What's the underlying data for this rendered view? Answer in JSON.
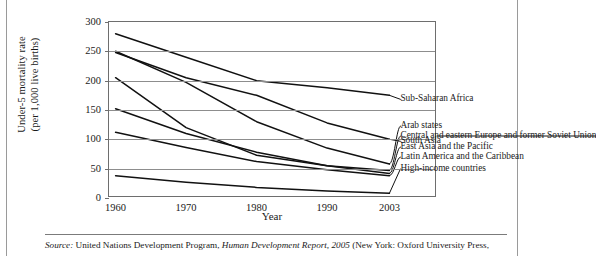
{
  "figure": {
    "source_prefix": "Source:",
    "source_text_a": " United Nations Development Program, ",
    "source_italic": "Human Development Report, 2005",
    "source_text_b": " (New York: Oxford University Press,"
  },
  "chart_data": {
    "type": "line",
    "title": "",
    "xlabel": "Year",
    "ylabel": "Under-5 mortality rate",
    "ylabel_line2": "(per 1,000 live births)",
    "x": [
      1960,
      1970,
      1980,
      1990,
      2003
    ],
    "xticklabels": [
      "1960",
      "1970",
      "1980",
      "1990",
      "2003"
    ],
    "yticklabels": [
      "0",
      "50",
      "100",
      "150",
      "200",
      "250",
      "300"
    ],
    "yticks": [
      0,
      50,
      100,
      150,
      200,
      250,
      300
    ],
    "ylim": [
      0,
      300
    ],
    "xlim": [
      1960,
      2003
    ],
    "grid": true,
    "legend": "inline-right-labels",
    "series": [
      {
        "name": "Sub-Saharan Africa",
        "values": [
          280,
          240,
          200,
          188,
          175
        ]
      },
      {
        "name": "South Asia",
        "values": [
          248,
          205,
          175,
          128,
          100
        ]
      },
      {
        "name": "Arab states",
        "values": [
          250,
          197,
          130,
          85,
          58
        ]
      },
      {
        "name": "Central and eastern Europe and former Soviet Union",
        "values": [
          205,
          120,
          73,
          55,
          47
        ]
      },
      {
        "name": "East Asia and the Pacific",
        "values": [
          152,
          110,
          78,
          55,
          42
        ]
      },
      {
        "name": "Latin America and the Caribbean",
        "values": [
          112,
          86,
          62,
          48,
          38
        ]
      },
      {
        "name": "High-income countries",
        "values": [
          38,
          27,
          18,
          12,
          8
        ]
      }
    ]
  }
}
